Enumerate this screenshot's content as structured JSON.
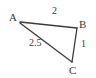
{
  "diagram": {
    "type": "triangle",
    "stroke_color": "#3b3b3b",
    "background_color": "#ffffff",
    "vertices": [
      {
        "name": "A",
        "label": "A",
        "x": 20,
        "y": 22
      },
      {
        "name": "B",
        "label": "B",
        "x": 77,
        "y": 28
      },
      {
        "name": "C",
        "label": "C",
        "x": 72,
        "y": 62
      }
    ],
    "sides": [
      {
        "name": "AB",
        "from": "A",
        "to": "B",
        "label": "2"
      },
      {
        "name": "BC",
        "from": "B",
        "to": "C",
        "label": "1"
      },
      {
        "name": "AC",
        "from": "A",
        "to": "C",
        "label": "2.5"
      }
    ]
  }
}
